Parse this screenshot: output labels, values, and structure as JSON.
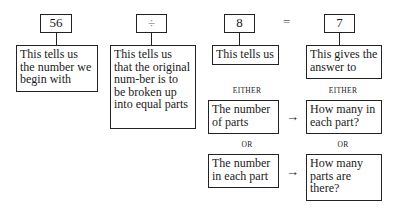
{
  "equation": {
    "dividend": "56",
    "operator": "÷",
    "divisor": "8",
    "equals": "=",
    "quotient": "7"
  },
  "explanations": {
    "dividend": "This tells us the number we begin with",
    "operator": "This tells us that the original num-ber is to be broken up into equal parts",
    "divisor": "This tells us",
    "quotient": "This gives the answer to"
  },
  "labels": {
    "either_left": "EITHER",
    "either_right": "EITHER",
    "or_left": "OR",
    "or_right": "OR"
  },
  "cases": [
    {
      "divisor_meaning": "The number of parts",
      "quotient_meaning": "How many in each part?"
    },
    {
      "divisor_meaning": "The number in each part",
      "quotient_meaning": "How many parts are there?"
    }
  ],
  "arrow_symbol": "→"
}
